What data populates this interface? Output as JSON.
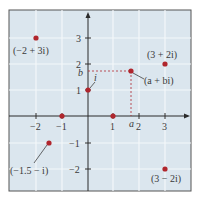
{
  "diagram": {
    "type": "complex-plane",
    "colors": {
      "background": "#dbe6ee",
      "grid": "#f4f7fa",
      "frame": "#555555",
      "axis": "#2b2b2b",
      "point": "#b0262d",
      "dashed": "#b0262d"
    },
    "x_ticks": [
      {
        "value": -2,
        "label": "−2"
      },
      {
        "value": -1,
        "label": "−1"
      },
      {
        "value": 1,
        "label": "1"
      },
      {
        "value": 2,
        "label": "2"
      },
      {
        "value": 3,
        "label": "3"
      }
    ],
    "y_ticks": [
      {
        "value": 3,
        "label": "3"
      },
      {
        "value": 2,
        "label": "2"
      },
      {
        "value": 1,
        "label": "1"
      },
      {
        "value": -1,
        "label": "−1"
      },
      {
        "value": -2,
        "label": "−2"
      }
    ],
    "points": [
      {
        "label": "(−2 + 3i)",
        "re": -2,
        "im": 3
      },
      {
        "label": "(3 + 2i)",
        "re": 3,
        "im": 2
      },
      {
        "label": "(a + bi)",
        "re": 1.7,
        "im": 1.7
      },
      {
        "label": "i",
        "re": 0,
        "im": 1
      },
      {
        "label": "(−1.5 − i)",
        "re": -1.5,
        "im": -1
      },
      {
        "label": "(3 − 2i)",
        "re": 3,
        "im": -2
      },
      {
        "label": "",
        "re": 1,
        "im": 0
      },
      {
        "label": "",
        "re": -1,
        "im": 0
      }
    ],
    "projection_labels": {
      "a": "a",
      "b": "b"
    }
  }
}
